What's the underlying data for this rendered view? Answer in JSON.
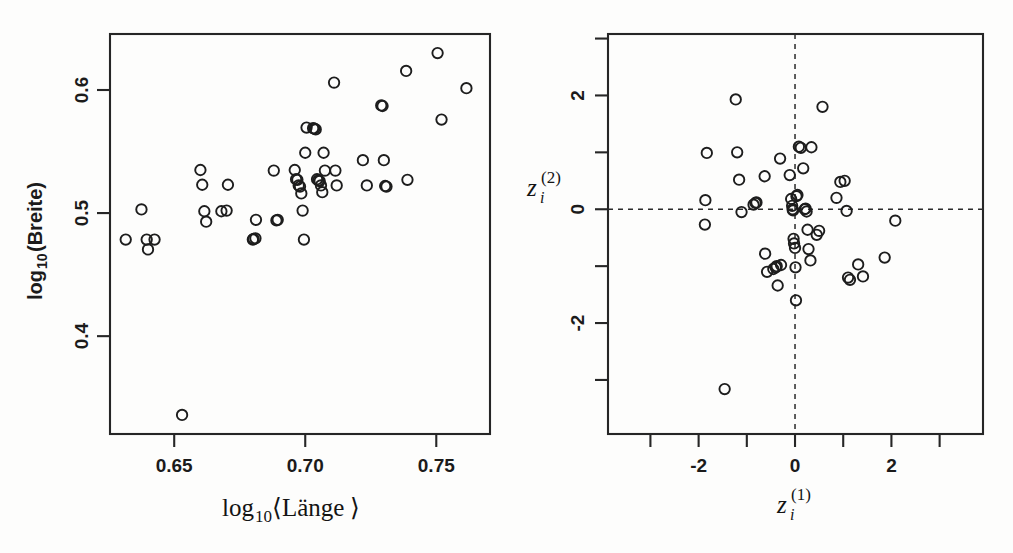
{
  "figure": {
    "background": "#fdfdfc",
    "ink": "#1b1b1b",
    "panels": 2
  },
  "chart_data": [
    {
      "type": "scatter",
      "panel": "left",
      "title": "",
      "xlabel": "log10<Länge>",
      "ylabel": "log10 (Breite)",
      "xlabel_parts": {
        "main": "log",
        "sub": "10",
        "open": "⟨",
        "arg": "Länge",
        "close": "⟩"
      },
      "ylabel_parts": {
        "main": "log",
        "sub": "10",
        "rest": "(Breite)"
      },
      "xlim": [
        0.6255,
        0.7705
      ],
      "ylim": [
        0.3205,
        0.6455
      ],
      "xticks": [
        0.65,
        0.7,
        0.75
      ],
      "xticklabels": [
        "0.65",
        "0.70",
        "0.75"
      ],
      "yticks": [
        0.4,
        0.5,
        0.6
      ],
      "yticklabels": [
        "0.4",
        "0.5",
        "0.6"
      ],
      "grid": false,
      "legend": null,
      "marker": "open-circle",
      "n_points": 52,
      "x": [
        0.6315,
        0.6375,
        0.6395,
        0.64,
        0.6425,
        0.66,
        0.6607,
        0.6615,
        0.6622,
        0.668,
        0.67,
        0.6705,
        0.68,
        0.6803,
        0.681,
        0.6812,
        0.688,
        0.689,
        0.6895,
        0.696,
        0.6965,
        0.697,
        0.6975,
        0.698,
        0.6985,
        0.699,
        0.6995,
        0.7,
        0.7005,
        0.703,
        0.7035,
        0.704,
        0.7045,
        0.705,
        0.7055,
        0.706,
        0.7065,
        0.707,
        0.7075,
        0.711,
        0.7115,
        0.712,
        0.722,
        0.7235,
        0.729,
        0.7295,
        0.73,
        0.7305,
        0.731,
        0.7385,
        0.739,
        0.7505,
        0.752,
        0.7615,
        0.653
      ],
      "y": [
        0.4785,
        0.503,
        0.4785,
        0.4705,
        0.4785,
        0.535,
        0.523,
        0.5015,
        0.493,
        0.5015,
        0.502,
        0.523,
        0.4785,
        0.479,
        0.4795,
        0.4945,
        0.5345,
        0.494,
        0.4945,
        0.535,
        0.5275,
        0.527,
        0.5225,
        0.5215,
        0.516,
        0.502,
        0.4785,
        0.549,
        0.5695,
        0.569,
        0.5685,
        0.568,
        0.5275,
        0.5265,
        0.526,
        0.5225,
        0.517,
        0.549,
        0.5345,
        0.606,
        0.5345,
        0.5225,
        0.543,
        0.5225,
        0.5875,
        0.587,
        0.543,
        0.522,
        0.5215,
        0.6155,
        0.527,
        0.63,
        0.576,
        0.6015,
        0.336
      ]
    },
    {
      "type": "scatter",
      "panel": "right",
      "title": "",
      "xlabel": "z_i^(1)",
      "ylabel": "z_i^(2)",
      "xlabel_parts": {
        "main": "z",
        "sub": "i",
        "sup": "(1)"
      },
      "ylabel_parts": {
        "main": "z",
        "sub": "i",
        "sup": "(2)"
      },
      "xlim": [
        -3.88,
        3.9
      ],
      "ylim": [
        -3.95,
        3.08
      ],
      "xticks": [
        -3,
        -2,
        -1,
        0,
        1,
        2,
        3
      ],
      "xticklabels": [
        "",
        "-2",
        "",
        "0",
        "",
        "2",
        ""
      ],
      "yticks": [
        -3,
        -2,
        -1,
        0,
        1,
        2,
        3
      ],
      "yticklabels": [
        "",
        "-2",
        "",
        "0",
        "",
        "2",
        ""
      ],
      "grid": false,
      "reference_lines": {
        "hline_y": 0,
        "vline_x": 0,
        "style": "dashed"
      },
      "legend": null,
      "marker": "open-circle",
      "n_points": 52,
      "x": [
        -1.83,
        -1.86,
        -1.87,
        -1.23,
        -1.2,
        -1.16,
        -1.11,
        -0.86,
        -0.82,
        -0.8,
        -0.63,
        -0.62,
        -0.58,
        -0.45,
        -0.4,
        -0.38,
        -0.36,
        -0.31,
        -0.29,
        -0.11,
        -0.08,
        -0.06,
        -0.05,
        -0.04,
        -0.03,
        -0.02,
        0.0,
        0.01,
        0.02,
        0.03,
        0.05,
        0.08,
        0.12,
        0.17,
        0.2,
        0.22,
        0.24,
        0.26,
        0.28,
        0.32,
        0.34,
        0.45,
        0.5,
        0.57,
        0.86,
        0.94,
        1.03,
        1.07,
        1.1,
        1.14,
        1.31,
        1.41,
        1.86,
        2.08,
        -1.46
      ],
      "y": [
        0.99,
        0.16,
        -0.27,
        1.93,
        1.0,
        0.52,
        -0.05,
        0.08,
        0.11,
        0.12,
        0.58,
        -0.78,
        -1.1,
        -1.05,
        -1.02,
        -1.0,
        -1.34,
        0.89,
        -0.98,
        0.6,
        0.18,
        0.06,
        0.0,
        -0.02,
        -0.52,
        -0.6,
        -0.68,
        -1.02,
        -1.6,
        0.23,
        0.25,
        1.1,
        1.08,
        0.72,
        0.0,
        0.01,
        -0.04,
        -0.36,
        -0.7,
        -0.9,
        1.09,
        -0.45,
        -0.38,
        1.8,
        0.2,
        0.48,
        0.5,
        -0.03,
        -1.2,
        -1.24,
        -0.97,
        -1.18,
        -0.85,
        -0.2,
        -3.16
      ]
    }
  ]
}
